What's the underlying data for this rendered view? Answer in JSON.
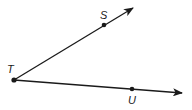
{
  "diagram": {
    "type": "geometry-angle",
    "colors": {
      "stroke": "#1a1a1a",
      "background": "#ffffff"
    },
    "vertex": {
      "label": "T",
      "x": 14,
      "y": 80
    },
    "points": [
      {
        "label": "S",
        "x": 104,
        "y": 25
      },
      {
        "label": "U",
        "x": 132,
        "y": 89
      }
    ],
    "rays": [
      {
        "name": "ray-TS",
        "from": "T",
        "through": "S",
        "arrow_tip": [
          133,
          8
        ]
      },
      {
        "name": "ray-TU",
        "from": "T",
        "through": "U",
        "arrow_tip": [
          182,
          93
        ]
      }
    ],
    "labels": {
      "T": "T",
      "S": "S",
      "U": "U"
    }
  }
}
